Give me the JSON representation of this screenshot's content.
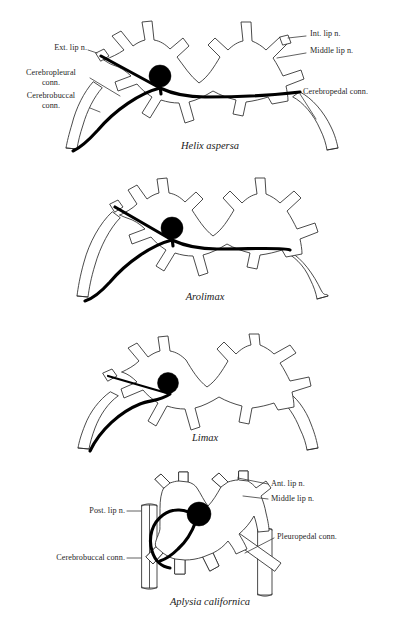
{
  "figure": {
    "background_color": "#ffffff",
    "ink_color": "#2b2b2b",
    "tract_color": "#000000",
    "panels": [
      {
        "id": "helix",
        "species": "Helix aspersa",
        "species_x": 150,
        "species_y": 142,
        "labels": [
          {
            "name": "ext-lip-n",
            "text": "Ext. lip n.",
            "x": 21,
            "y": 47,
            "align": "right",
            "width": 66
          },
          {
            "name": "cerebropleural-conn",
            "text": "Cerebropleural\nconn.",
            "x": 14,
            "y": 72,
            "align": "right",
            "width": 74
          },
          {
            "name": "cerebrobuccal-conn",
            "text": "Cerebrobuccal\nconn.",
            "x": 14,
            "y": 95,
            "align": "right",
            "width": 74
          },
          {
            "name": "int-lip-n",
            "text": "Int. lip n.",
            "x": 310,
            "y": 33,
            "align": "left",
            "width": 80
          },
          {
            "name": "middle-lip-n",
            "text": "Middle lip n.",
            "x": 310,
            "y": 50,
            "align": "left",
            "width": 90
          },
          {
            "name": "cerebropedal-conn",
            "text": "Cerebropedal conn.",
            "x": 303,
            "y": 91,
            "align": "left",
            "width": 110
          }
        ]
      },
      {
        "id": "arolimax",
        "species": "Arolimax",
        "species_x": 175,
        "species_y": 293,
        "labels": []
      },
      {
        "id": "limax",
        "species": "Limax",
        "species_x": 185,
        "species_y": 434,
        "labels": []
      },
      {
        "id": "aplysia",
        "species": "Aplysia californica",
        "species_x": 145,
        "species_y": 598,
        "labels": [
          {
            "name": "post-lip-n",
            "text": "Post. lip n.",
            "x": 73,
            "y": 508,
            "align": "right",
            "width": 66
          },
          {
            "name": "cerebrobuccal-conn",
            "text": "Cerebrobuccal conn.",
            "x": 28,
            "y": 554,
            "align": "right",
            "width": 110
          },
          {
            "name": "ant-lip-n",
            "text": "Ant. lip n.",
            "x": 272,
            "y": 480,
            "align": "left",
            "width": 80
          },
          {
            "name": "middle-lip-n",
            "text": "Middle lip n.",
            "x": 272,
            "y": 495,
            "align": "left",
            "width": 90
          },
          {
            "name": "pleuropedal-conn",
            "text": "Pleuropedal conn.",
            "x": 277,
            "y": 535,
            "align": "left",
            "width": 105
          }
        ]
      }
    ]
  }
}
